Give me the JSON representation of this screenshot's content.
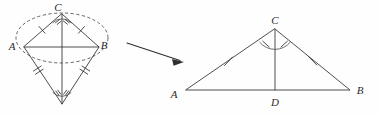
{
  "figure": {
    "background_color": "#fefefe",
    "line_color": "#3a3a3a",
    "dash_color": "#555555"
  },
  "left_figure": {
    "name": "construction-kite",
    "description": "Compass construction: dashed arc circle through apex with rhombus and angle marks",
    "labels": {
      "apex": "C",
      "left": "A",
      "right": "B"
    },
    "points": {
      "apex": {
        "x": 62,
        "y": 14
      },
      "left": {
        "x": 24,
        "y": 47
      },
      "right": {
        "x": 99,
        "y": 47
      },
      "bottom": {
        "x": 62,
        "y": 104
      }
    },
    "label_positions": {
      "apex": {
        "x": 58,
        "y": 11
      },
      "left": {
        "x": 12,
        "y": 50
      },
      "right": {
        "x": 101,
        "y": 49
      }
    },
    "ellipse": {
      "cx": 62,
      "cy": 38,
      "rx": 46,
      "ry": 25
    },
    "tick_counts": {
      "upper_edges": 1,
      "lower_edges": 2,
      "apex_angle_marks": 2,
      "bottom_angle_marks": 2
    }
  },
  "right_figure": {
    "name": "result-triangle",
    "description": "Triangle ABC with angle bisector CD meeting AB at D; congruent sides marked",
    "labels": {
      "apex": "C",
      "left": "A",
      "right": "B",
      "foot": "D"
    },
    "points": {
      "apex": {
        "x": 275,
        "y": 29
      },
      "left": {
        "x": 186,
        "y": 90
      },
      "right": {
        "x": 350,
        "y": 90
      },
      "foot": {
        "x": 275,
        "y": 90
      }
    },
    "label_positions": {
      "apex": {
        "x": 271,
        "y": 23
      },
      "left": {
        "x": 172,
        "y": 97
      },
      "right": {
        "x": 358,
        "y": 95
      },
      "foot": {
        "x": 271,
        "y": 104
      }
    },
    "tick_counts": {
      "side_ac": 1,
      "side_bc": 1,
      "apex_angle_marks": 2
    }
  },
  "arrow": {
    "name": "transform-arrow",
    "from": {
      "x": 127,
      "y": 43
    },
    "to": {
      "x": 184,
      "y": 62
    }
  }
}
